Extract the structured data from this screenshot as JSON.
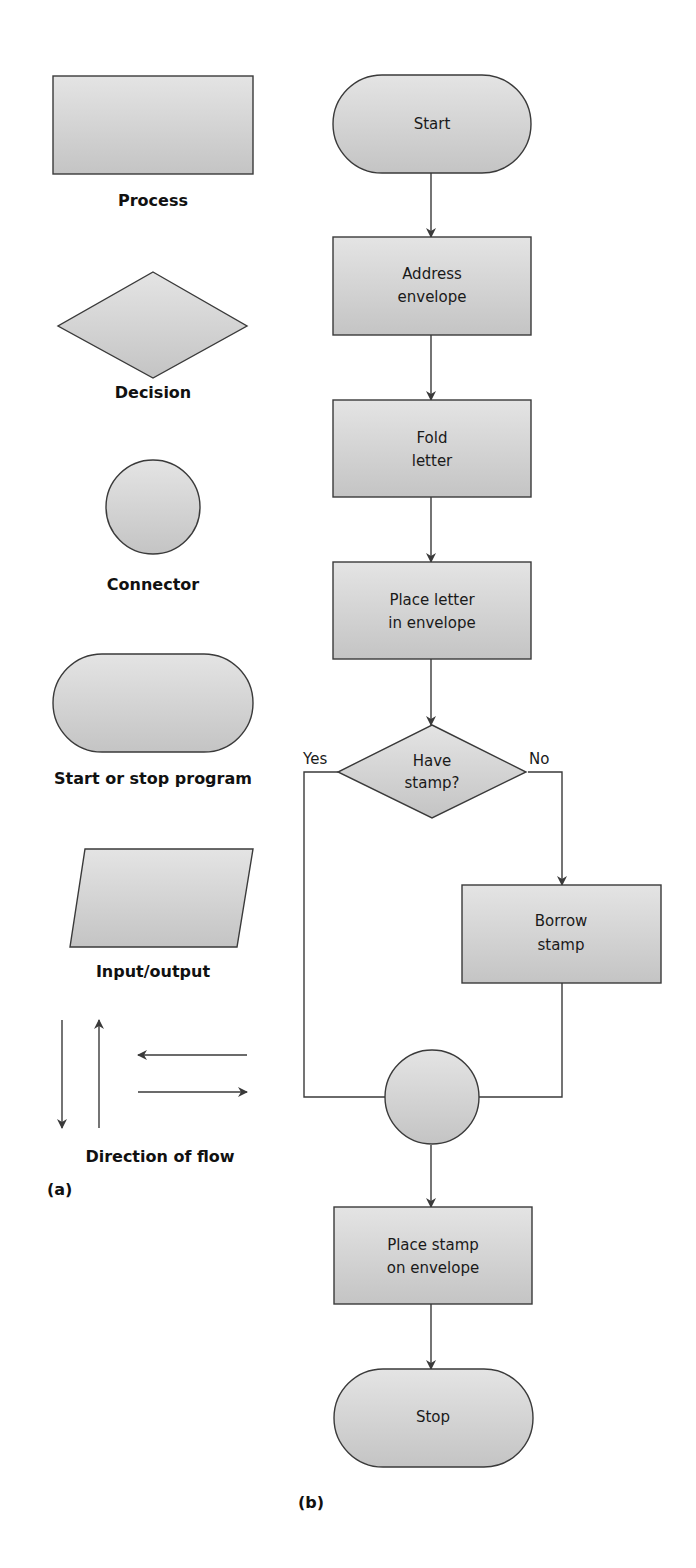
{
  "legend": {
    "panel_label": "(a)",
    "items": [
      {
        "shape": "rectangle",
        "label": "Process"
      },
      {
        "shape": "diamond",
        "label": "Decision"
      },
      {
        "shape": "circle",
        "label": "Connector"
      },
      {
        "shape": "rounded-terminal",
        "label": "Start or stop program"
      },
      {
        "shape": "parallelogram",
        "label": "Input/output"
      },
      {
        "shape": "arrows",
        "label": "Direction of flow"
      }
    ]
  },
  "flowchart": {
    "panel_label": "(b)",
    "nodes": [
      {
        "id": "start",
        "shape": "terminal",
        "lines": [
          "Start"
        ]
      },
      {
        "id": "address",
        "shape": "process",
        "lines": [
          "Address",
          "envelope"
        ]
      },
      {
        "id": "fold",
        "shape": "process",
        "lines": [
          "Fold",
          "letter"
        ]
      },
      {
        "id": "place-letter",
        "shape": "process",
        "lines": [
          "Place letter",
          "in envelope"
        ]
      },
      {
        "id": "have-stamp",
        "shape": "decision",
        "lines": [
          "Have",
          "stamp?"
        ]
      },
      {
        "id": "borrow",
        "shape": "process",
        "lines": [
          "Borrow",
          "stamp"
        ]
      },
      {
        "id": "connector",
        "shape": "connector",
        "lines": []
      },
      {
        "id": "place-stamp",
        "shape": "process",
        "lines": [
          "Place stamp",
          "on envelope"
        ]
      },
      {
        "id": "stop",
        "shape": "terminal",
        "lines": [
          "Stop"
        ]
      }
    ],
    "branches": {
      "yes": "Yes",
      "no": "No"
    }
  },
  "colors": {
    "fill_light": "#e4e4e4",
    "fill_dark": "#c4c4c4",
    "stroke": "#3a3a3a"
  }
}
